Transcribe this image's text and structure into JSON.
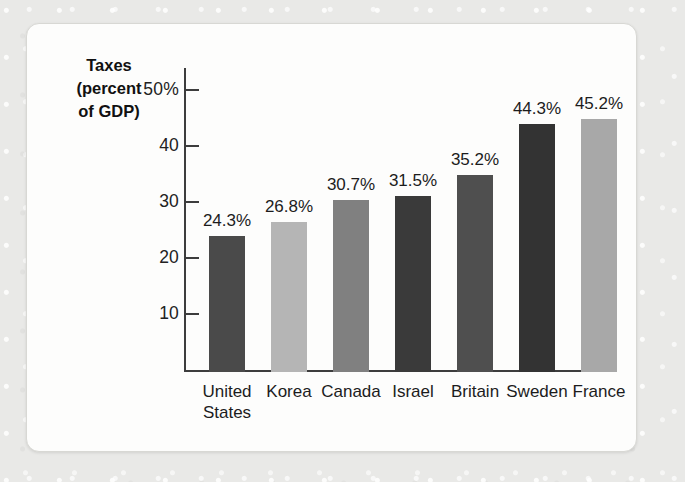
{
  "chart_data": {
    "type": "bar",
    "title": "Taxes (percent of GDP)",
    "title_lines": [
      "Taxes",
      "(percent",
      "of GDP)"
    ],
    "xlabel": "",
    "ylabel": "Taxes (percent of GDP)",
    "ylim": [
      0,
      52
    ],
    "grid": false,
    "legend": "none",
    "ytick_values": [
      50,
      40,
      30,
      20,
      10
    ],
    "ytick_labels": [
      "50%",
      "40",
      "30",
      "20",
      "10"
    ],
    "categories": [
      "United States",
      "Korea",
      "Canada",
      "Israel",
      "Britain",
      "Sweden",
      "France"
    ],
    "category_label_lines": [
      [
        "United",
        "States"
      ],
      [
        "Korea"
      ],
      [
        "Canada"
      ],
      [
        "Israel"
      ],
      [
        "Britain"
      ],
      [
        "Sweden"
      ],
      [
        "France"
      ]
    ],
    "values": [
      24.3,
      26.8,
      30.7,
      31.5,
      35.2,
      44.3,
      45.2
    ],
    "value_labels": [
      "24.3%",
      "26.8%",
      "30.7%",
      "31.5%",
      "35.2%",
      "44.3%",
      "45.2%"
    ],
    "bar_colors": [
      "#4a4a4a",
      "#b5b5b5",
      "#808080",
      "#3a3a3a",
      "#4f4f4f",
      "#333333",
      "#a8a8a8"
    ]
  },
  "figure": {
    "background_color": "#fdfdfc",
    "axis_color": "#3d3d3d"
  }
}
